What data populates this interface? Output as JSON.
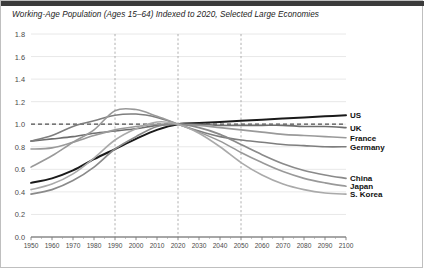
{
  "chart_data": {
    "type": "line",
    "title": "Working-Age Population (Ages 15–64) Indexed to 2020, Selected Large Economies",
    "xlabel": "",
    "ylabel": "",
    "xlim": [
      1950,
      2100
    ],
    "ylim": [
      0.0,
      1.8
    ],
    "grid": true,
    "legend_position": "right-inline",
    "reference_line_y": 1.0,
    "vertical_reference_lines": [
      1990,
      2020,
      2050
    ],
    "ytick_labels": [
      "0.0",
      "0.2",
      "0.4",
      "0.6",
      "0.8",
      "1.0",
      "1.2",
      "1.4",
      "1.6",
      "1.8"
    ],
    "ytick_values": [
      0.0,
      0.2,
      0.4,
      0.6,
      0.8,
      1.0,
      1.2,
      1.4,
      1.6,
      1.8
    ],
    "xtick_labels": [
      "1950",
      "1960",
      "1970",
      "1980",
      "1990",
      "2000",
      "2010",
      "2020",
      "2030",
      "2040",
      "2050",
      "2060",
      "2070",
      "2080",
      "2090",
      "2100"
    ],
    "xtick_values": [
      1950,
      1960,
      1970,
      1980,
      1990,
      2000,
      2010,
      2020,
      2030,
      2040,
      2050,
      2060,
      2070,
      2080,
      2090,
      2100
    ],
    "x": [
      1950,
      1960,
      1970,
      1980,
      1990,
      2000,
      2010,
      2020,
      2030,
      2040,
      2050,
      2060,
      2070,
      2080,
      2090,
      2100
    ],
    "series": [
      {
        "name": "US",
        "color": "#1a1a1a",
        "width": 2.0,
        "label_y": 1.08,
        "values": [
          0.48,
          0.52,
          0.59,
          0.69,
          0.78,
          0.87,
          0.95,
          1.0,
          1.01,
          1.02,
          1.03,
          1.04,
          1.05,
          1.06,
          1.07,
          1.08
        ]
      },
      {
        "name": "UK",
        "color": "#6e6e6e",
        "width": 1.6,
        "label_y": 0.97,
        "values": [
          0.85,
          0.87,
          0.89,
          0.92,
          0.94,
          0.96,
          0.99,
          1.0,
          1.0,
          0.99,
          0.99,
          0.99,
          0.99,
          0.98,
          0.98,
          0.97
        ]
      },
      {
        "name": "France",
        "color": "#9a9a9a",
        "width": 1.6,
        "label_y": 0.88,
        "values": [
          0.78,
          0.79,
          0.84,
          0.9,
          0.95,
          0.98,
          1.0,
          1.0,
          0.99,
          0.97,
          0.95,
          0.93,
          0.91,
          0.9,
          0.89,
          0.88
        ]
      },
      {
        "name": "Germany",
        "color": "#7e7e7e",
        "width": 1.6,
        "label_y": 0.8,
        "values": [
          0.85,
          0.9,
          0.98,
          1.03,
          1.08,
          1.09,
          1.06,
          1.0,
          0.94,
          0.89,
          0.86,
          0.84,
          0.82,
          0.81,
          0.8,
          0.8
        ]
      },
      {
        "name": "China",
        "color": "#8a8a8a",
        "width": 1.7,
        "label_y": 0.52,
        "values": [
          0.38,
          0.42,
          0.5,
          0.62,
          0.78,
          0.89,
          0.98,
          1.0,
          0.97,
          0.91,
          0.82,
          0.73,
          0.65,
          0.59,
          0.55,
          0.52
        ]
      },
      {
        "name": "Japan",
        "color": "#999999",
        "width": 1.6,
        "label_y": 0.45,
        "values": [
          0.62,
          0.72,
          0.84,
          0.95,
          1.12,
          1.13,
          1.07,
          1.0,
          0.93,
          0.85,
          0.75,
          0.66,
          0.58,
          0.52,
          0.48,
          0.45
        ]
      },
      {
        "name": "S. Korea",
        "color": "#aaaaaa",
        "width": 1.6,
        "label_y": 0.38,
        "values": [
          0.42,
          0.47,
          0.56,
          0.7,
          0.86,
          0.96,
          1.02,
          1.0,
          0.92,
          0.8,
          0.66,
          0.55,
          0.47,
          0.42,
          0.39,
          0.38
        ]
      }
    ]
  },
  "axis": {
    "y_title": "",
    "x_title": ""
  }
}
